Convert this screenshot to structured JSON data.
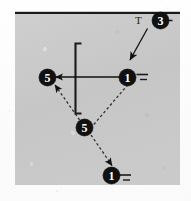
{
  "figure": {
    "kind": "technical-line-diagram",
    "background_color": "#c9c9c9",
    "ink_color": "#111111",
    "page_color": "#fdfdfd",
    "top_rule": {
      "label": "top-border-rule",
      "color": "#1a1a1a"
    },
    "text_labels": [
      {
        "name": "t-label",
        "text": "T"
      }
    ],
    "callouts": [
      {
        "name": "callout-3",
        "text": "3",
        "x": 152,
        "y": 20,
        "has_tick": true,
        "tick_count": 1
      },
      {
        "name": "callout-1-center",
        "text": "1",
        "x": 127,
        "y": 69,
        "has_tick": true,
        "tick_count": 2
      },
      {
        "name": "callout-5-left",
        "text": "5",
        "x": 43,
        "y": 69,
        "has_tick": false,
        "tick_count": 0
      },
      {
        "name": "callout-5-lower",
        "text": "5",
        "x": 81,
        "y": 124,
        "has_tick": false,
        "tick_count": 0
      },
      {
        "name": "callout-1-bottom",
        "text": "1",
        "x": 110,
        "y": 170,
        "has_tick": true,
        "tick_count": 2
      }
    ],
    "bracket": {
      "name": "bracket-shape",
      "description": "open square bracket",
      "color": "#1a1a1a"
    },
    "connectors": [
      {
        "name": "connector-3-to-1",
        "style": "solid",
        "arrow": "end"
      },
      {
        "name": "connector-1-to-5-left",
        "style": "solid",
        "arrow": "end"
      },
      {
        "name": "connector-1-to-5-lower",
        "style": "dashed",
        "arrow": "none"
      },
      {
        "name": "connector-5-to-5-left",
        "style": "dashed",
        "arrow": "end"
      },
      {
        "name": "connector-5-to-1-bottom",
        "style": "dashed",
        "arrow": "end"
      }
    ]
  }
}
